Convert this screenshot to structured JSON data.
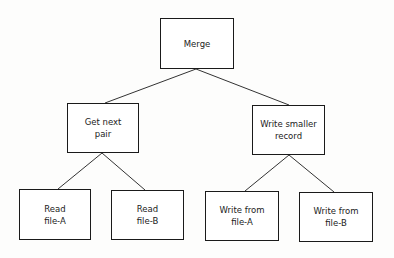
{
  "diagram": {
    "type": "hierarchy-chart",
    "nodes": {
      "merge": {
        "label": "Merge",
        "x": 160,
        "y": 18,
        "w": 74,
        "h": 51
      },
      "get_next_pair": {
        "label": "Get next\npair",
        "x": 67,
        "y": 103,
        "w": 72,
        "h": 50
      },
      "write_smaller_record": {
        "label": "Write smaller\nrecord",
        "x": 252,
        "y": 105,
        "w": 73,
        "h": 50
      },
      "read_file_a": {
        "label": "Read\nfile-A",
        "x": 19,
        "y": 189,
        "w": 72,
        "h": 51
      },
      "read_file_b": {
        "label": "Read\nfile-B",
        "x": 111,
        "y": 190,
        "w": 73,
        "h": 50
      },
      "write_from_file_a": {
        "label": "Write from\nfile-A",
        "x": 205,
        "y": 191,
        "w": 74,
        "h": 50
      },
      "write_from_file_b": {
        "label": "Write from\nfile-B",
        "x": 299,
        "y": 192,
        "w": 74,
        "h": 50
      }
    },
    "edges": [
      {
        "from": "merge",
        "to": "get_next_pair"
      },
      {
        "from": "merge",
        "to": "write_smaller_record"
      },
      {
        "from": "get_next_pair",
        "to": "read_file_a"
      },
      {
        "from": "get_next_pair",
        "to": "read_file_b"
      },
      {
        "from": "write_smaller_record",
        "to": "write_from_file_a"
      },
      {
        "from": "write_smaller_record",
        "to": "write_from_file_b"
      }
    ],
    "colors": {
      "line": "#333333",
      "border": "#1a1a1a",
      "background": "#fdfdfc"
    }
  }
}
